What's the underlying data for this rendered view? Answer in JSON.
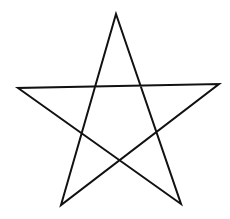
{
  "figure": {
    "shape": "pentagram",
    "stroke_color": "#111111",
    "stroke_width": 2,
    "background": "#ffffff",
    "vertices": {
      "top": [
        116,
        14
      ],
      "left": [
        18,
        88
      ],
      "right": [
        219,
        84
      ],
      "bottom_left": [
        61,
        205
      ],
      "bottom_right": [
        181,
        204
      ]
    },
    "path_order": [
      "top",
      "bottom_left",
      "right",
      "left",
      "bottom_right",
      "top"
    ]
  }
}
